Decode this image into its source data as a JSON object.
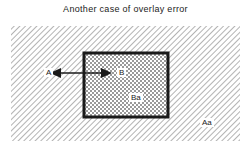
{
  "title": "Another case of overlay error",
  "regions": {
    "outer": {
      "label": "Aa",
      "fill": "diagonal-hatch"
    },
    "inner": {
      "label": "Ba",
      "fill": "crosshatch"
    }
  },
  "points": {
    "a": "A",
    "b": "B"
  },
  "arrow": {
    "type": "double-headed",
    "from": "A",
    "to": "B"
  },
  "colors": {
    "ink": "#1a1a1a",
    "hatch": "#8a8a8a",
    "background": "#ffffff"
  }
}
